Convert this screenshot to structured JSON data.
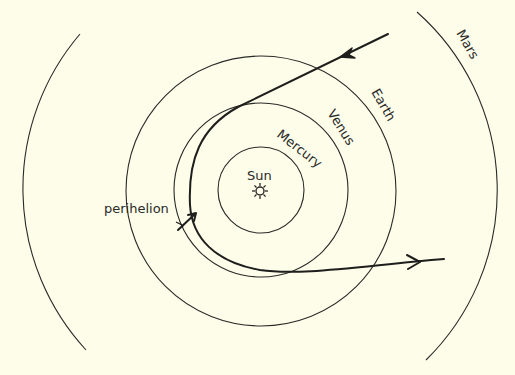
{
  "diagram": {
    "type": "orbit-diagram",
    "center": {
      "label": "Sun",
      "icon": "sun-icon"
    },
    "orbits": [
      {
        "name": "Mercury",
        "label": "Mercury",
        "radius": 43
      },
      {
        "name": "Venus",
        "label": "Venus",
        "radius": 87
      },
      {
        "name": "Earth",
        "label": "Earth",
        "radius": 135
      },
      {
        "name": "Mars",
        "label": "Mars",
        "radius": 238
      }
    ],
    "trajectory": {
      "label": "perihelion",
      "description": "Comet path passing inside Venus orbit, with direction arrows inbound (upper right) and outbound (lower right)"
    }
  },
  "colors": {
    "background": "#fdfdea",
    "line": "#2a2a28"
  }
}
